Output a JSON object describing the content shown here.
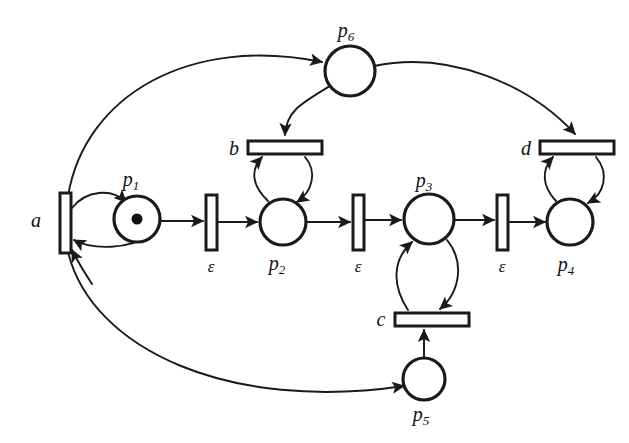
{
  "diagram": {
    "background_color": "#ffffff",
    "stroke_color": "#1a1a1a",
    "width": 629,
    "height": 443
  },
  "places": [
    {
      "id": "p1",
      "label": "p",
      "subscript": "1",
      "cx": 137,
      "cy": 219,
      "r": 23,
      "tokens": 1
    },
    {
      "id": "p2",
      "label": "p",
      "subscript": "2",
      "cx": 283,
      "cy": 222,
      "r": 23,
      "tokens": 0
    },
    {
      "id": "p3",
      "label": "p",
      "subscript": "3",
      "cx": 429,
      "cy": 219,
      "r": 25,
      "tokens": 0
    },
    {
      "id": "p4",
      "label": "p",
      "subscript": "4",
      "cx": 570,
      "cy": 222,
      "r": 23,
      "tokens": 0
    },
    {
      "id": "p5",
      "label": "p",
      "subscript": "5",
      "cx": 424,
      "cy": 379,
      "r": 21,
      "tokens": 0
    },
    {
      "id": "p6",
      "label": "p",
      "subscript": "6",
      "cx": 350,
      "cy": 71,
      "r": 25,
      "tokens": 0
    }
  ],
  "transitions": [
    {
      "id": "a",
      "label": "a",
      "orientation": "vertical",
      "x": 60,
      "y": 193,
      "w": 11,
      "h": 60
    },
    {
      "id": "e1",
      "label": "ε",
      "orientation": "vertical",
      "x": 206,
      "y": 195,
      "w": 11,
      "h": 55
    },
    {
      "id": "e2",
      "label": "ε",
      "orientation": "vertical",
      "x": 353,
      "y": 195,
      "w": 11,
      "h": 55
    },
    {
      "id": "e3",
      "label": "ε",
      "orientation": "vertical",
      "x": 497,
      "y": 195,
      "w": 11,
      "h": 55
    },
    {
      "id": "b",
      "label": "b",
      "orientation": "horizontal",
      "x": 248,
      "y": 141,
      "w": 74,
      "h": 13
    },
    {
      "id": "c",
      "label": "c",
      "orientation": "horizontal",
      "x": 395,
      "y": 313,
      "w": 74,
      "h": 13
    },
    {
      "id": "d",
      "label": "d",
      "orientation": "horizontal",
      "x": 540,
      "y": 141,
      "w": 74,
      "h": 13
    }
  ],
  "labels": {
    "a": "a",
    "b": "b",
    "c": "c",
    "d": "d",
    "epsilon": "ε",
    "p1": "p",
    "p1_sub": "1",
    "p2": "p",
    "p2_sub": "2",
    "p3": "p",
    "p3_sub": "3",
    "p4": "p",
    "p4_sub": "4",
    "p5": "p",
    "p5_sub": "5",
    "p6": "p",
    "p6_sub": "6"
  },
  "arcs": [
    {
      "from": "a",
      "to": "p1",
      "kind": "curve-top"
    },
    {
      "from": "p1",
      "to": "a",
      "kind": "curve-bottom"
    },
    {
      "from": "p1",
      "to": "e1",
      "kind": "straight"
    },
    {
      "from": "e1",
      "to": "p2",
      "kind": "straight"
    },
    {
      "from": "b",
      "to": "p2",
      "kind": "curve-right"
    },
    {
      "from": "p2",
      "to": "b",
      "kind": "curve-left"
    },
    {
      "from": "p2",
      "to": "e2",
      "kind": "straight"
    },
    {
      "from": "e2",
      "to": "p3",
      "kind": "straight"
    },
    {
      "from": "p3",
      "to": "c",
      "kind": "curve-right"
    },
    {
      "from": "c",
      "to": "p3",
      "kind": "curve-left"
    },
    {
      "from": "p3",
      "to": "e3",
      "kind": "straight"
    },
    {
      "from": "e3",
      "to": "p4",
      "kind": "straight"
    },
    {
      "from": "d",
      "to": "p4",
      "kind": "curve-right"
    },
    {
      "from": "p4",
      "to": "d",
      "kind": "curve-left"
    },
    {
      "from": "a",
      "to": "p6",
      "kind": "long-curve-top"
    },
    {
      "from": "p6",
      "to": "b",
      "kind": "long-curve"
    },
    {
      "from": "p6",
      "to": "d",
      "kind": "long-curve"
    },
    {
      "from": "a",
      "to": "p5",
      "kind": "long-curve-bottom"
    },
    {
      "from": "p5",
      "to": "c",
      "kind": "straight-up"
    }
  ]
}
